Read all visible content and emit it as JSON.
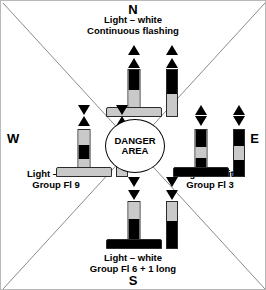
{
  "diagram": {
    "center_label_line1": "DANGER",
    "center_label_line2": "AREA",
    "background_color": "#ffffff",
    "line_color": "#808080",
    "black": "#000000",
    "gray": "#c9c9c9"
  },
  "sectors": {
    "north": {
      "compass": "N",
      "caption_line1": "Light – white",
      "caption_line2": "Continuous flashing",
      "topmark": "two-cones-points-up",
      "cone1": "▲",
      "cone2": "▲",
      "body_bands": [
        "black",
        "gray"
      ]
    },
    "east": {
      "compass": "E",
      "caption_line1": "Light – white",
      "caption_line2": "Group Fl 3",
      "topmark": "two-cones-base-to-base",
      "cone1": "▲",
      "cone2": "▼",
      "body_bands": [
        "black",
        "gray",
        "black"
      ]
    },
    "south": {
      "compass": "S",
      "caption_line1": "Light – white",
      "caption_line2": "Group Fl 6 + 1 long",
      "topmark": "two-cones-points-down",
      "cone1": "▼",
      "cone2": "▼",
      "body_bands": [
        "gray",
        "black"
      ]
    },
    "west": {
      "compass": "W",
      "caption_line1": "Light – white",
      "caption_line2": "Group Fl 9",
      "topmark": "two-cones-point-to-point",
      "cone1": "▼",
      "cone2": "▲",
      "body_bands": [
        "gray",
        "black",
        "gray"
      ]
    }
  }
}
